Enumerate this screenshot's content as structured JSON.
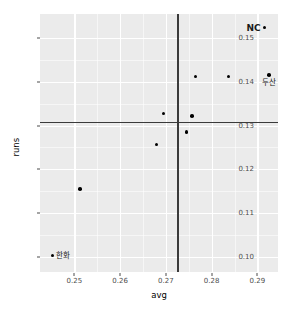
{
  "chart_data": {
    "type": "scatter",
    "title": "",
    "xlabel": "avg",
    "ylabel": "runs",
    "xlim": [
      0.2425,
      0.2945
    ],
    "ylim": [
      0.0965,
      0.1555
    ],
    "xticks": [
      "0.25",
      "0.26",
      "0.27",
      "0.28",
      "0.29"
    ],
    "xtick_values": [
      0.25,
      0.26,
      0.27,
      0.28,
      0.29
    ],
    "yticks": [
      "0.10",
      "0.11",
      "0.12",
      "0.13",
      "0.14",
      "0.15"
    ],
    "ytick_values": [
      0.1,
      0.11,
      0.12,
      0.13,
      0.14,
      0.15
    ],
    "grid": true,
    "legend": "none",
    "reference_lines": [
      {
        "orientation": "vertical",
        "value": 0.2725
      },
      {
        "orientation": "horizontal",
        "value": 0.1308
      }
    ],
    "points": [
      {
        "x": 0.2452,
        "y": 0.1003,
        "label": "한화",
        "label_pos": "right",
        "label_style": "normal"
      },
      {
        "x": 0.2512,
        "y": 0.1155,
        "label": "",
        "label_pos": "",
        "label_style": "normal"
      },
      {
        "x": 0.268,
        "y": 0.1257,
        "label": "",
        "label_pos": "",
        "label_style": "normal"
      },
      {
        "x": 0.2695,
        "y": 0.1328,
        "label": "",
        "label_pos": "",
        "label_style": "normal"
      },
      {
        "x": 0.2745,
        "y": 0.1285,
        "label": "",
        "label_pos": "",
        "label_style": "normal"
      },
      {
        "x": 0.2757,
        "y": 0.1322,
        "label": "",
        "label_pos": "",
        "label_style": "normal"
      },
      {
        "x": 0.2765,
        "y": 0.1412,
        "label": "",
        "label_pos": "",
        "label_style": "normal"
      },
      {
        "x": 0.2837,
        "y": 0.1412,
        "label": "",
        "label_pos": "",
        "label_style": "normal"
      },
      {
        "x": 0.2916,
        "y": 0.1524,
        "label": "NC",
        "label_pos": "left",
        "label_style": "bold"
      },
      {
        "x": 0.2925,
        "y": 0.1416,
        "label": "두산",
        "label_pos": "below",
        "label_style": "normal"
      }
    ],
    "colors": {
      "panel_background": "#ebebeb",
      "gridline": "#ffffff",
      "point": "#000000",
      "reference_line": "#3a3a3a",
      "axis_text": "#4d4d4d",
      "axis_title": "#000000",
      "figure_background": "#ffffff"
    }
  }
}
